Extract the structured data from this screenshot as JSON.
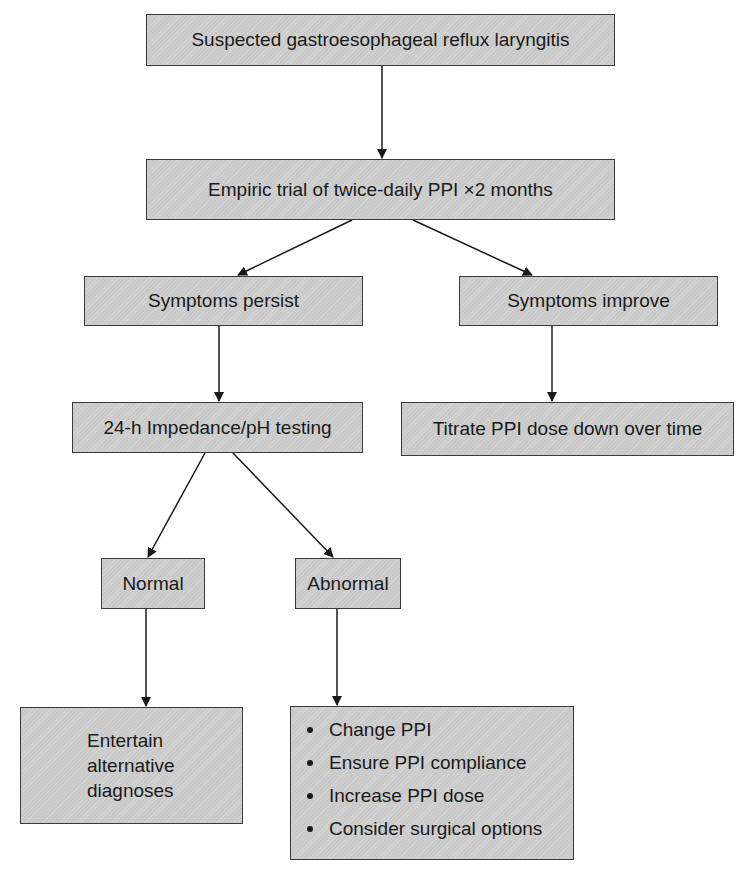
{
  "diagram": {
    "type": "flowchart",
    "nodes": {
      "start": {
        "label": "Suspected gastroesophageal reflux laryngitis"
      },
      "trial": {
        "label": "Empiric trial of twice-daily PPI ×2 months"
      },
      "persist": {
        "label": "Symptoms persist"
      },
      "improve": {
        "label": "Symptoms improve"
      },
      "testing": {
        "label": "24-h Impedance/pH testing"
      },
      "titrate": {
        "label": "Titrate PPI dose down over time"
      },
      "normal": {
        "label": "Normal"
      },
      "abnormal": {
        "label": "Abnormal"
      },
      "alternative": {
        "lines": [
          "Entertain",
          "alternative",
          "diagnoses"
        ]
      },
      "actions": {
        "items": [
          "Change PPI",
          "Ensure PPI compliance",
          "Increase PPI dose",
          "Consider surgical options"
        ]
      }
    },
    "edges": [
      {
        "from": "start",
        "to": "trial"
      },
      {
        "from": "trial",
        "to": "persist"
      },
      {
        "from": "trial",
        "to": "improve"
      },
      {
        "from": "persist",
        "to": "testing"
      },
      {
        "from": "improve",
        "to": "titrate"
      },
      {
        "from": "testing",
        "to": "normal"
      },
      {
        "from": "testing",
        "to": "abnormal"
      },
      {
        "from": "normal",
        "to": "alternative"
      },
      {
        "from": "abnormal",
        "to": "actions"
      }
    ],
    "colors": {
      "box_fill": "#cfcfcf",
      "box_border": "#3a3a3a",
      "arrow": "#1a1a1a",
      "background": "#ffffff"
    }
  }
}
